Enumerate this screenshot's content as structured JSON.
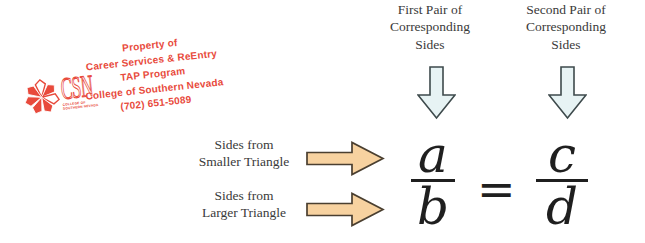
{
  "stamp": {
    "color": "#e84a3c",
    "logo": {
      "acronym": "CSN",
      "tagline_line1": "COLLEGE OF",
      "tagline_line2": "SOUTHERN NEVADA"
    },
    "lines": [
      "Property of",
      "Career Services & ReEntry",
      "TAP Program",
      "College of Southern Nevada",
      "(702) 651-5089"
    ]
  },
  "headers": {
    "first_pair": "First Pair of\nCorresponding\nSides",
    "second_pair": "Second Pair of\nCorresponding\nSides"
  },
  "row_labels": {
    "smaller": "Sides from\nSmaller Triangle",
    "larger": "Sides from\nLarger Triangle"
  },
  "proportion": {
    "left_numerator": "a",
    "left_denominator": "b",
    "equals": "=",
    "right_numerator": "c",
    "right_denominator": "d"
  },
  "colors": {
    "down_arrow_fill": "#e7f3f4",
    "down_arrow_stroke": "#3e4a4c",
    "right_arrow_fill": "#f7d2a0",
    "right_arrow_stroke": "#4a3f30",
    "label_text": "#3a3a3a",
    "math_ink": "#1f1f1f",
    "stamp_red": "#e84a3c",
    "background": "#ffffff"
  }
}
